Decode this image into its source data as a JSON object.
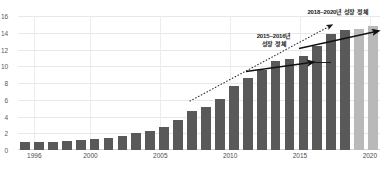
{
  "chart_data": {
    "type": "bar",
    "title": "",
    "xlabel": "",
    "ylabel": "",
    "ylim": [
      0,
      16
    ],
    "y_ticks": [
      "0",
      "2",
      "4",
      "6",
      "8",
      "10",
      "12",
      "14",
      "16"
    ],
    "x_ticks": [
      "1996",
      "2000",
      "2005",
      "2010",
      "2015",
      "2020"
    ],
    "grid": true,
    "legend": "none",
    "categories": [
      "1996",
      "1997",
      "1998",
      "1999",
      "2000",
      "2001",
      "2002",
      "2003",
      "2004",
      "2005",
      "2006",
      "2007",
      "2008",
      "2009",
      "2010",
      "2011",
      "2012",
      "2013",
      "2014",
      "2015",
      "2016",
      "2017",
      "2018",
      "2019",
      "2020",
      "2021"
    ],
    "values": [
      0.9,
      0.95,
      1.0,
      1.1,
      1.2,
      1.3,
      1.45,
      1.7,
      2.0,
      2.3,
      2.8,
      3.6,
      4.6,
      5.1,
      6.1,
      7.6,
      8.6,
      9.6,
      10.6,
      10.9,
      11.2,
      12.4,
      13.9,
      14.3,
      14.5,
      14.8
    ],
    "series": [
      {
        "name": "연도별 값",
        "values": [
          0.9,
          0.95,
          1.0,
          1.1,
          1.2,
          1.3,
          1.45,
          1.7,
          2.0,
          2.3,
          2.8,
          3.6,
          4.6,
          5.1,
          6.1,
          7.6,
          8.6,
          9.6,
          10.6,
          10.9,
          11.2,
          12.4,
          13.9,
          14.3,
          14.5,
          14.8
        ]
      }
    ],
    "bar_colors": {
      "primary": "#595959",
      "highlight": "#b9b9b9",
      "highlight_categories": [
        "2020",
        "2021"
      ]
    },
    "annotations": [
      {
        "id": "stagnation-2015-2016",
        "text": "2015~2016년\n성장 정체",
        "x": 273,
        "y": 36
      },
      {
        "id": "stagnation-2018-2020",
        "text": "2018~2020년 성장 정체",
        "x": 337,
        "y": 12
      }
    ],
    "trendlines": [
      {
        "id": "dotted-growth-trend",
        "style": "dotted",
        "color": "#2a2a2a",
        "from": [
          190,
          101
        ],
        "to": [
          333,
          24
        ],
        "arrow": "end"
      },
      {
        "id": "solid-plateau-2015",
        "style": "solid",
        "color": "#111111",
        "from": [
          246,
          71
        ],
        "to": [
          313,
          62
        ],
        "arrow": "end"
      },
      {
        "id": "solid-plateau-2018",
        "style": "solid",
        "color": "#111111",
        "from": [
          300,
          48
        ],
        "to": [
          378,
          31
        ],
        "arrow": "end"
      }
    ]
  }
}
